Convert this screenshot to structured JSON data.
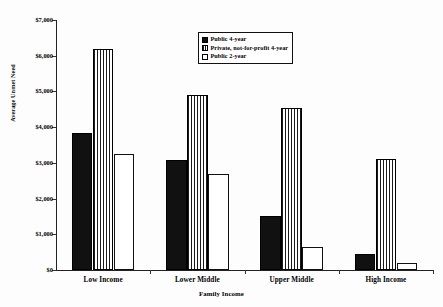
{
  "chart_data": {
    "type": "bar",
    "title": "",
    "xlabel": "Family Income",
    "ylabel": "Average Unmet Need",
    "categories": [
      "Low Income",
      "Lower Middle",
      "Upper Middle",
      "High Income"
    ],
    "series": [
      {
        "name": "Public 4-year",
        "values": [
          3830,
          3080,
          1510,
          440
        ]
      },
      {
        "name": "Private, not-for-profit 4-year",
        "values": [
          6190,
          4900,
          4550,
          3110
        ]
      },
      {
        "name": "Public 2-year",
        "values": [
          3250,
          2700,
          650,
          200
        ]
      }
    ],
    "ylim": [
      0,
      7000
    ],
    "ytick_values": [
      0,
      1000,
      2000,
      3000,
      4000,
      5000,
      6000,
      7000
    ],
    "ytick_labels": [
      "$0",
      "$1,000",
      "$2,000",
      "$3,000",
      "$4,000",
      "$5,000",
      "$6,000",
      "$7,000"
    ],
    "grid": false,
    "legend_position": "top-center"
  },
  "legend": {
    "entries": [
      {
        "label": "Public 4-year",
        "style": "solid-black"
      },
      {
        "label": "Private, not-for-profit 4-year",
        "style": "vertical-stripes"
      },
      {
        "label": "Public 2-year",
        "style": "white-outline"
      }
    ]
  }
}
